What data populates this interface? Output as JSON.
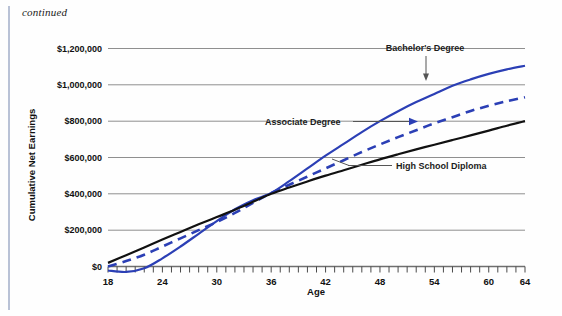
{
  "page": {
    "continued_note": "continued"
  },
  "chart_data": {
    "type": "line",
    "title": "",
    "xlabel": "Age",
    "ylabel": "Cumulative Net Earnings",
    "xlim": [
      18,
      64
    ],
    "ylim": [
      -60000,
      1260000
    ],
    "grid": true,
    "grid_axis": "y",
    "legend_position": "inline-annotations",
    "x_tick_interval": 1,
    "x_label_interval": 6,
    "x_tick_labels": [
      "18",
      "24",
      "30",
      "36",
      "42",
      "48",
      "54",
      "60",
      "64"
    ],
    "x_tick_values": [
      18,
      24,
      30,
      36,
      42,
      48,
      54,
      60,
      64
    ],
    "y_tick_labels": [
      "$0",
      "$200,000",
      "$400,000",
      "$600,000",
      "$800,000",
      "$1,000,000",
      "$1,200,000"
    ],
    "y_tick_values": [
      0,
      200000,
      400000,
      600000,
      800000,
      1000000,
      1200000
    ],
    "x": [
      18,
      20,
      22,
      24,
      26,
      28,
      30,
      32,
      34,
      36,
      38,
      40,
      42,
      44,
      46,
      48,
      50,
      52,
      54,
      56,
      58,
      60,
      62,
      64
    ],
    "series": [
      {
        "name": "Bachelor's Degree",
        "style": "solid",
        "color": "#2B3FB5",
        "values": [
          -22000,
          -30000,
          -10000,
          45000,
          110000,
          180000,
          250000,
          315000,
          365000,
          405000,
          470000,
          540000,
          610000,
          675000,
          740000,
          800000,
          855000,
          905000,
          950000,
          995000,
          1030000,
          1060000,
          1085000,
          1105000
        ]
      },
      {
        "name": "Associate Degree",
        "style": "dashed",
        "color": "#2B3FB5",
        "values": [
          0,
          30000,
          65000,
          110000,
          155000,
          200000,
          245000,
          295000,
          350000,
          405000,
          450000,
          495000,
          540000,
          585000,
          630000,
          672000,
          712000,
          750000,
          788000,
          822000,
          856000,
          885000,
          910000,
          932000
        ]
      },
      {
        "name": "High School Diploma",
        "style": "solid",
        "color": "#111111",
        "values": [
          20000,
          62000,
          105000,
          148000,
          190000,
          232000,
          272000,
          312000,
          356000,
          400000,
          435000,
          468000,
          500000,
          530000,
          560000,
          590000,
          618000,
          645000,
          670000,
          696000,
          722000,
          748000,
          775000,
          800000
        ]
      }
    ],
    "annotations": [
      {
        "text": "Bachelor's Degree",
        "series": "Bachelor's Degree",
        "pointer": "arrow-down"
      },
      {
        "text": "Associate Degree",
        "series": "Associate Degree",
        "pointer": "arrow-right"
      },
      {
        "text": "High School Diploma",
        "series": "High School Diploma",
        "pointer": "line-left"
      }
    ]
  }
}
